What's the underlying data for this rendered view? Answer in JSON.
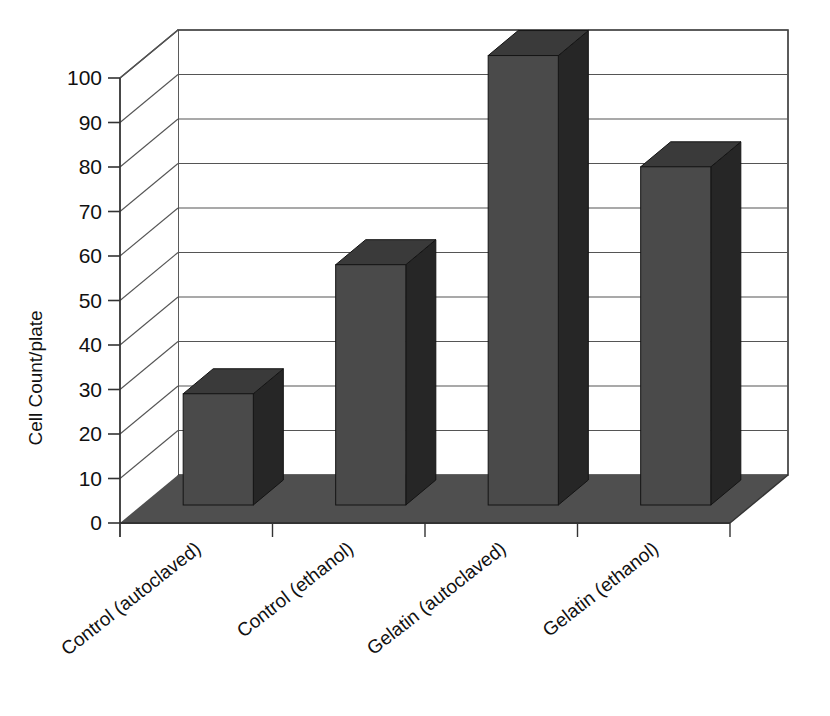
{
  "chart_data": {
    "type": "bar",
    "title": "",
    "subtitle": "",
    "xlabel": "",
    "ylabel": "Cell Count/plate",
    "categories": [
      "Control (autoclaved)",
      "Control (ethanol)",
      "Gelatin (autoclaved)",
      "Gelatin (ethanol)"
    ],
    "values": [
      25,
      54,
      101,
      76
    ],
    "ylim": [
      0,
      100
    ],
    "ytick_labels": [
      "0",
      "10",
      "20",
      "30",
      "40",
      "50",
      "60",
      "70",
      "80",
      "90",
      "100"
    ],
    "ytick_values": [
      0,
      10,
      20,
      30,
      40,
      50,
      60,
      70,
      80,
      90,
      100
    ],
    "grid": true,
    "legend": false,
    "legend_position": "none",
    "three_d": true,
    "series": [
      {
        "name": "Cell Count/plate",
        "values": [
          25,
          54,
          101,
          76
        ]
      }
    ],
    "annotations": []
  },
  "style": {
    "bar_front_color": "#4a4a4a",
    "bar_top_color": "#3a3a3a",
    "bar_side_color": "#262626",
    "floor_color": "#4f4f4f",
    "wall_color": "#ffffff",
    "grid_color": "#555555",
    "axis_color": "#333333",
    "background_color": "#ffffff",
    "text_color": "#111111"
  }
}
